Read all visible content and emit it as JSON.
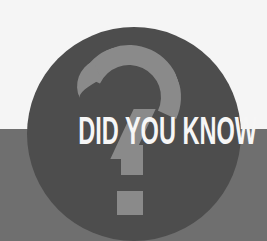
{
  "badge": {
    "title": "DID YOU KNOW",
    "icon": "question-mark-icon",
    "colors": {
      "background_top": "#f5f5f5",
      "background_band": "#6f6f6f",
      "circle": "#4d4d4d",
      "question_mark": "#8a8a8a",
      "text": "#f6f6f6"
    }
  }
}
